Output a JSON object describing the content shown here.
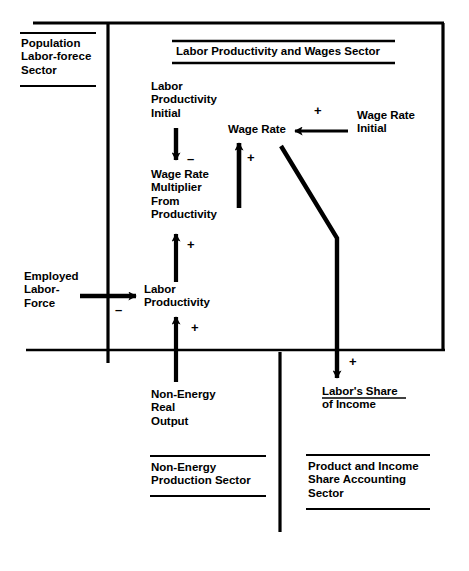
{
  "diagram": {
    "title": "Labor Productivity and Wages Sector",
    "sectors": [
      {
        "id": "population-labor-force",
        "label": "Population\nLabor-forece\nSector"
      },
      {
        "id": "labor-productivity-wages",
        "label": "Labor Productivity and Wages Sector"
      },
      {
        "id": "non-energy-production",
        "label": "Non-Energy\nProduction Sector"
      },
      {
        "id": "product-income-share-accounting",
        "label": "Product and Income\nShare Accounting\nSector"
      }
    ],
    "nodes": [
      {
        "id": "labor-productivity-initial",
        "label": "Labor\nProductivity\nInitial"
      },
      {
        "id": "wage-rate-multiplier-from-productivity",
        "label": "Wage Rate\nMultiplier\nFrom\nProductivity"
      },
      {
        "id": "wage-rate",
        "label": "Wage Rate"
      },
      {
        "id": "wage-rate-initial",
        "label": "Wage Rate\nInitial"
      },
      {
        "id": "employed-labor-force",
        "label": "Employed\nLabor-\nForce"
      },
      {
        "id": "labor-productivity",
        "label": "Labor\nProductivity"
      },
      {
        "id": "non-energy-real-output",
        "label": "Non-Energy\nReal\nOutput"
      },
      {
        "id": "labors-share-of-income",
        "label": "Labor's Share\nof Income"
      }
    ],
    "links": [
      {
        "id": "lpi-to-wrm",
        "from": "labor-productivity-initial",
        "to": "wage-rate-multiplier-from-productivity",
        "sign": "–"
      },
      {
        "id": "wrm-to-wage-rate",
        "from": "wage-rate-multiplier-from-productivity",
        "to": "wage-rate",
        "sign": "+"
      },
      {
        "id": "wri-to-wage-rate",
        "from": "wage-rate-initial",
        "to": "wage-rate",
        "sign": "+"
      },
      {
        "id": "elf-to-lp",
        "from": "employed-labor-force",
        "to": "labor-productivity",
        "sign": "–"
      },
      {
        "id": "lp-to-wrm",
        "from": "labor-productivity",
        "to": "wage-rate-multiplier-from-productivity",
        "sign": "+"
      },
      {
        "id": "nero-to-lp",
        "from": "non-energy-real-output",
        "to": "labor-productivity",
        "sign": "+"
      },
      {
        "id": "wage-rate-to-lsi",
        "from": "wage-rate",
        "to": "labors-share-of-income",
        "sign": "+"
      }
    ],
    "colors": {
      "ink": "#000000",
      "background": "#ffffff"
    }
  }
}
